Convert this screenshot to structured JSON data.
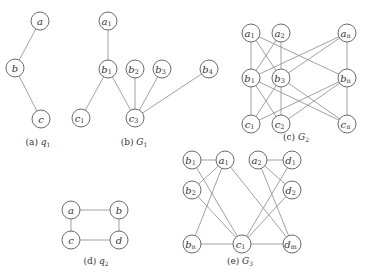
{
  "figure": {
    "node_radius": 9,
    "colors": {
      "edge": "#8a8a8a",
      "node_stroke": "#6a6a6a",
      "text": "#333333",
      "background": "#ffffff"
    },
    "subfigures": [
      {
        "id": "q1",
        "caption": {
          "tag": "(a)",
          "name": "q",
          "sub": "1",
          "x": 38,
          "y": 145
        },
        "nodes": [
          {
            "id": "a",
            "label": "a",
            "sub": "",
            "x": 40,
            "y": 21
          },
          {
            "id": "b",
            "label": "b",
            "sub": "",
            "x": 15,
            "y": 68
          },
          {
            "id": "c",
            "label": "c",
            "sub": "",
            "x": 41,
            "y": 119
          }
        ],
        "edges": [
          [
            "a",
            "b"
          ],
          [
            "b",
            "c"
          ]
        ]
      },
      {
        "id": "G1",
        "caption": {
          "tag": "(b)",
          "name": "G",
          "sub": "1",
          "x": 134,
          "y": 145
        },
        "nodes": [
          {
            "id": "a1",
            "label": "a",
            "sub": "1",
            "x": 108,
            "y": 21
          },
          {
            "id": "b1",
            "label": "b",
            "sub": "1",
            "x": 108,
            "y": 69
          },
          {
            "id": "b2",
            "label": "b",
            "sub": "2",
            "x": 135,
            "y": 69
          },
          {
            "id": "b3",
            "label": "b",
            "sub": "3",
            "x": 162,
            "y": 69
          },
          {
            "id": "b4",
            "label": "b",
            "sub": "4",
            "x": 209,
            "y": 69
          },
          {
            "id": "c1",
            "label": "c",
            "sub": "1",
            "x": 81,
            "y": 118
          },
          {
            "id": "c3",
            "label": "c",
            "sub": "3",
            "x": 135,
            "y": 118
          }
        ],
        "edges": [
          [
            "a1",
            "b1"
          ],
          [
            "b1",
            "c1"
          ],
          [
            "b1",
            "c3"
          ],
          [
            "b2",
            "c3"
          ],
          [
            "b3",
            "c3"
          ],
          [
            "b4",
            "c3"
          ]
        ]
      },
      {
        "id": "G2",
        "caption": {
          "tag": "(c)",
          "name": "G",
          "sub": "2",
          "x": 296,
          "y": 140
        },
        "nodes": [
          {
            "id": "a1",
            "label": "a",
            "sub": "1",
            "x": 251,
            "y": 33
          },
          {
            "id": "a2",
            "label": "a",
            "sub": "2",
            "x": 281,
            "y": 33
          },
          {
            "id": "an",
            "label": "a",
            "sub": "n",
            "x": 347,
            "y": 33
          },
          {
            "id": "b1",
            "label": "b",
            "sub": "1",
            "x": 251,
            "y": 78
          },
          {
            "id": "b3",
            "label": "b",
            "sub": "3",
            "x": 281,
            "y": 78
          },
          {
            "id": "bn",
            "label": "b",
            "sub": "n",
            "x": 347,
            "y": 78
          },
          {
            "id": "c1",
            "label": "c",
            "sub": "1",
            "x": 251,
            "y": 124
          },
          {
            "id": "c2",
            "label": "c",
            "sub": "2",
            "x": 281,
            "y": 124
          },
          {
            "id": "cn",
            "label": "c",
            "sub": "n",
            "x": 347,
            "y": 124
          }
        ],
        "edges": [
          [
            "a1",
            "b1"
          ],
          [
            "a1",
            "b3"
          ],
          [
            "a1",
            "bn"
          ],
          [
            "a2",
            "b1"
          ],
          [
            "a2",
            "b3"
          ],
          [
            "an",
            "b1"
          ],
          [
            "an",
            "b3"
          ],
          [
            "an",
            "bn"
          ],
          [
            "b1",
            "c1"
          ],
          [
            "b1",
            "c2"
          ],
          [
            "b1",
            "cn"
          ],
          [
            "b3",
            "c1"
          ],
          [
            "b3",
            "c2"
          ],
          [
            "b3",
            "cn"
          ],
          [
            "bn",
            "c1"
          ],
          [
            "bn",
            "c2"
          ],
          [
            "bn",
            "cn"
          ]
        ]
      },
      {
        "id": "q2",
        "caption": {
          "tag": "(d)",
          "name": "q",
          "sub": "2",
          "x": 96,
          "y": 264
        },
        "nodes": [
          {
            "id": "a",
            "label": "a",
            "sub": "",
            "x": 71,
            "y": 210
          },
          {
            "id": "b",
            "label": "b",
            "sub": "",
            "x": 119,
            "y": 210
          },
          {
            "id": "c",
            "label": "c",
            "sub": "",
            "x": 71,
            "y": 240
          },
          {
            "id": "d",
            "label": "d",
            "sub": "",
            "x": 119,
            "y": 240
          }
        ],
        "edges": [
          [
            "a",
            "b"
          ],
          [
            "a",
            "c"
          ],
          [
            "b",
            "d"
          ],
          [
            "c",
            "d"
          ]
        ]
      },
      {
        "id": "G3",
        "caption": {
          "tag": "(e)",
          "name": "G",
          "sub": "3",
          "x": 240,
          "y": 264
        },
        "nodes": [
          {
            "id": "b1",
            "label": "b",
            "sub": "1",
            "x": 192,
            "y": 160
          },
          {
            "id": "a1",
            "label": "a",
            "sub": "1",
            "x": 225,
            "y": 160
          },
          {
            "id": "a2",
            "label": "a",
            "sub": "2",
            "x": 258,
            "y": 160
          },
          {
            "id": "d1",
            "label": "d",
            "sub": "1",
            "x": 292,
            "y": 160
          },
          {
            "id": "b2",
            "label": "b",
            "sub": "2",
            "x": 192,
            "y": 190
          },
          {
            "id": "d2",
            "label": "d",
            "sub": "2",
            "x": 292,
            "y": 190
          },
          {
            "id": "bn",
            "label": "b",
            "sub": "n",
            "x": 192,
            "y": 244
          },
          {
            "id": "c1",
            "label": "c",
            "sub": "1",
            "x": 242,
            "y": 244
          },
          {
            "id": "dm",
            "label": "d",
            "sub": "m",
            "x": 292,
            "y": 244
          }
        ],
        "edges": [
          [
            "b1",
            "a1"
          ],
          [
            "a2",
            "d1"
          ],
          [
            "b1",
            "c1"
          ],
          [
            "b2",
            "a1"
          ],
          [
            "b2",
            "c1"
          ],
          [
            "bn",
            "a1"
          ],
          [
            "bn",
            "c1"
          ],
          [
            "a1",
            "dm"
          ],
          [
            "a2",
            "d2"
          ],
          [
            "a2",
            "dm"
          ],
          [
            "c1",
            "d1"
          ],
          [
            "c1",
            "d2"
          ],
          [
            "c1",
            "dm"
          ]
        ]
      }
    ]
  }
}
